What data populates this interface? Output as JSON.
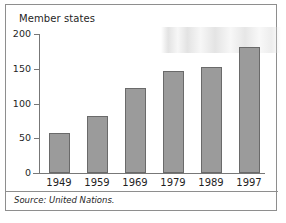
{
  "figure": {
    "source_note": "Source: United Nations.",
    "frame_color": "#8e8e8e"
  },
  "chart_data": {
    "type": "bar",
    "title": "Member states",
    "xlabel": "",
    "ylabel": "",
    "categories": [
      "1949",
      "1959",
      "1969",
      "1979",
      "1989",
      "1997"
    ],
    "values": [
      57,
      82,
      123,
      147,
      153,
      181
    ],
    "ylim": [
      0,
      200
    ],
    "yticks": [
      0,
      50,
      100,
      150,
      200
    ],
    "ytick_labels": [
      "0",
      "50",
      "100",
      "150",
      "200"
    ],
    "grid": false,
    "legend": "none",
    "bar_fill_color": "#9b9b9b",
    "bar_border_color": "#6a6a6a",
    "axis_color": "#777777"
  }
}
